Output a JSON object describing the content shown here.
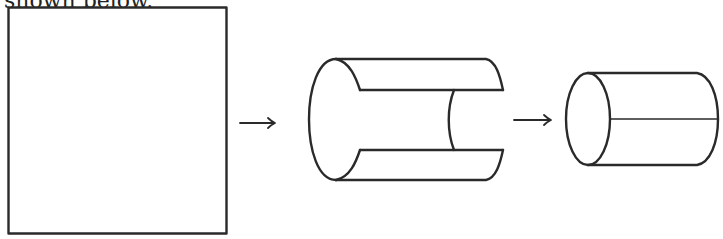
{
  "caption": {
    "text": "shown below."
  },
  "figures": [
    {
      "id": "square-sheet",
      "label": "flat square sheet"
    },
    {
      "id": "partially-rolled",
      "label": "partially rolled cylinder"
    },
    {
      "id": "cylinder",
      "label": "closed cylinder with seam"
    }
  ],
  "arrows": [
    {
      "id": "arrow-1",
      "symbol": "→"
    },
    {
      "id": "arrow-2",
      "symbol": "→"
    }
  ],
  "colors": {
    "stroke": "#2a2a2a",
    "background": "#ffffff"
  }
}
